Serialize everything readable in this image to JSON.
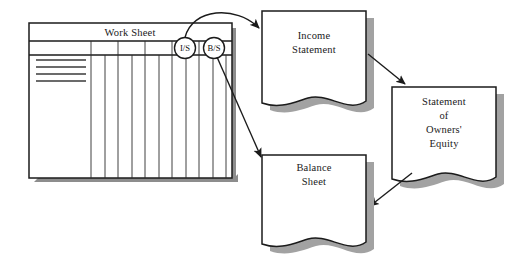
{
  "diagram": {
    "type": "accounting-flow-diagram",
    "background_color": "#ffffff",
    "ink_color": "#1b1b1b",
    "shadow_color": "#8d8d8d",
    "worksheet": {
      "title": "Work Sheet",
      "column_tags": [
        {
          "id": "is",
          "label": "I/S"
        },
        {
          "id": "bs",
          "label": "B/S"
        }
      ],
      "ruled_line_count": 4,
      "column_count": 10
    },
    "documents": [
      {
        "id": "income-statement",
        "lines": [
          "Income",
          "Statement"
        ]
      },
      {
        "id": "balance-sheet",
        "lines": [
          "Balance",
          "Sheet"
        ]
      },
      {
        "id": "owners-equity",
        "lines": [
          "Statement",
          "of",
          "Owners'",
          "Equity"
        ]
      }
    ],
    "connectors": [
      {
        "id": "is-tag-to-income-statement",
        "from": "I/S",
        "to": "Income Statement",
        "style": "curved"
      },
      {
        "id": "bs-tag-to-balance-sheet",
        "from": "B/S",
        "to": "Balance Sheet",
        "style": "straight"
      },
      {
        "id": "income-statement-to-owners-equity",
        "from": "Income Statement",
        "to": "Statement of Owners' Equity",
        "style": "straight"
      },
      {
        "id": "owners-equity-to-balance-sheet",
        "from": "Statement of Owners' Equity",
        "to": "Balance Sheet",
        "style": "straight"
      }
    ]
  }
}
